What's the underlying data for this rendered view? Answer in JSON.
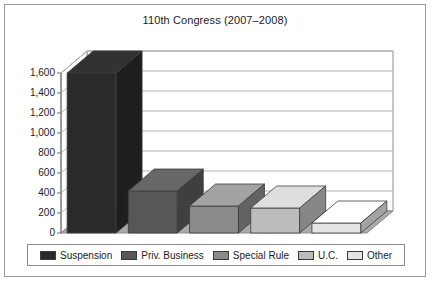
{
  "chart_data": {
    "type": "bar",
    "title": "110th Congress (2007–2008)",
    "xlabel": "",
    "ylabel": "",
    "ylim": [
      0,
      1600
    ],
    "ytick_step": 200,
    "grid": true,
    "three_d": true,
    "legend_position": "bottom",
    "categories": [
      "Suspension",
      "Priv. Business",
      "Special Rule",
      "U.C.",
      "Other"
    ],
    "values": [
      1600,
      420,
      270,
      250,
      100
    ],
    "colors": [
      "#2a2a2a",
      "#575757",
      "#8a8a8a",
      "#bcbcbc",
      "#e3e3e3"
    ],
    "ytick_labels": [
      "0",
      "200",
      "400",
      "600",
      "800",
      "1,000",
      "1,200",
      "1,400",
      "1,600"
    ],
    "ytick_values": [
      0,
      200,
      400,
      600,
      800,
      1000,
      1200,
      1400,
      1600
    ]
  },
  "legend": {
    "items": [
      {
        "label": "Suspension",
        "color": "#2a2a2a"
      },
      {
        "label": "Priv. Business",
        "color": "#575757"
      },
      {
        "label": "Special Rule",
        "color": "#8a8a8a"
      },
      {
        "label": "U.C.",
        "color": "#bcbcbc"
      },
      {
        "label": "Other",
        "color": "#e3e3e3"
      }
    ]
  },
  "style": {
    "floor_color": "#a9a9a9",
    "wall_color": "#ffffff",
    "gridline_color": "#b5b5b5",
    "border_color": "#9a9a9a"
  }
}
